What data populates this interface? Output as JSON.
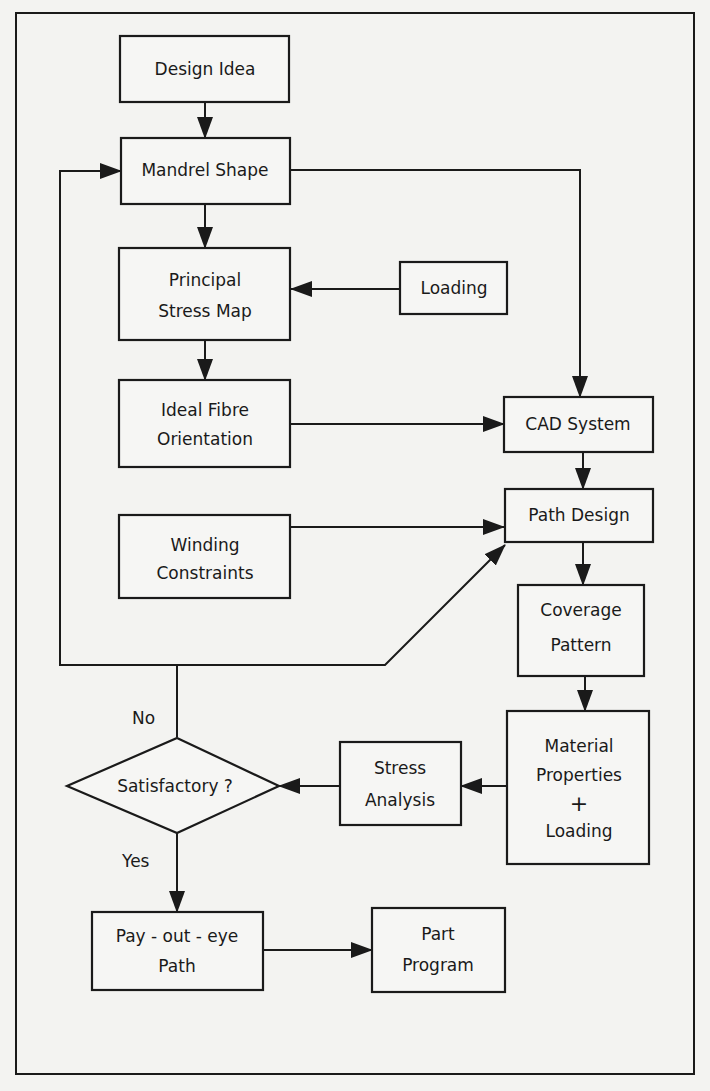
{
  "nodes": {
    "design_idea": {
      "lines": [
        "Design Idea"
      ]
    },
    "mandrel_shape": {
      "lines": [
        "Mandrel Shape"
      ]
    },
    "principal_stress_map": {
      "lines": [
        "Principal",
        "Stress Map"
      ]
    },
    "loading": {
      "lines": [
        "Loading"
      ]
    },
    "ideal_fibre_orientation": {
      "lines": [
        "Ideal Fibre",
        "Orientation"
      ]
    },
    "cad_system": {
      "lines": [
        "CAD System"
      ]
    },
    "winding_constraints": {
      "lines": [
        "Winding",
        "Constraints"
      ]
    },
    "path_design": {
      "lines": [
        "Path Design"
      ]
    },
    "coverage_pattern": {
      "lines": [
        "Coverage",
        "Pattern"
      ]
    },
    "material_properties_loading": {
      "lines": [
        "Material",
        "Properties",
        "+",
        "Loading"
      ]
    },
    "stress_analysis": {
      "lines": [
        "Stress",
        "Analysis"
      ]
    },
    "satisfactory": {
      "lines": [
        "Satisfactory ?"
      ]
    },
    "payout_eye_path": {
      "lines": [
        "Pay - out - eye",
        "Path"
      ]
    },
    "part_program": {
      "lines": [
        "Part",
        "Program"
      ]
    }
  },
  "branches": {
    "no": "No",
    "yes": "Yes"
  },
  "edges": [
    {
      "from": "Design Idea",
      "to": "Mandrel Shape"
    },
    {
      "from": "Mandrel Shape",
      "to": "Principal Stress Map"
    },
    {
      "from": "Mandrel Shape",
      "to": "CAD System"
    },
    {
      "from": "Loading",
      "to": "Principal Stress Map"
    },
    {
      "from": "Principal Stress Map",
      "to": "Ideal Fibre Orientation"
    },
    {
      "from": "Ideal Fibre Orientation",
      "to": "CAD System"
    },
    {
      "from": "CAD System",
      "to": "Path Design"
    },
    {
      "from": "Winding Constraints",
      "to": "Path Design"
    },
    {
      "from": "Path Design",
      "to": "Coverage Pattern"
    },
    {
      "from": "Coverage Pattern",
      "to": "Material Properties + Loading"
    },
    {
      "from": "Material Properties + Loading",
      "to": "Stress Analysis"
    },
    {
      "from": "Stress Analysis",
      "to": "Satisfactory ?"
    },
    {
      "from": "Satisfactory ?",
      "to": "Mandrel Shape",
      "label": "No"
    },
    {
      "from": "Satisfactory ?",
      "to": "Path Design",
      "label": "No"
    },
    {
      "from": "Satisfactory ?",
      "to": "Pay-out-eye Path",
      "label": "Yes"
    },
    {
      "from": "Pay-out-eye Path",
      "to": "Part Program"
    }
  ]
}
